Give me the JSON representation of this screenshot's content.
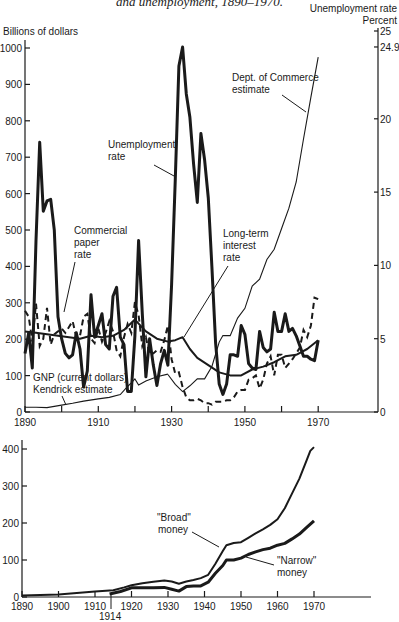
{
  "figure": {
    "title": "and unemployment, 1890–1970."
  },
  "chart_data": [
    {
      "type": "line",
      "title": "and unemployment, 1890–1970.",
      "xlabel": "",
      "ylabel": "Billions of dollars",
      "y2label": "Unemployment rate Percent",
      "xlim": [
        1890,
        1985
      ],
      "ylim": [
        0,
        1000
      ],
      "y2lim": [
        0,
        25
      ],
      "x_ticks": [
        1890,
        1900,
        1910,
        1920,
        1930,
        1940,
        1950,
        1960,
        1970
      ],
      "x_tick_labels": [
        "1890",
        "1910",
        "1930",
        "1950",
        "1970"
      ],
      "y_ticks": [
        0,
        100,
        200,
        300,
        400,
        500,
        600,
        700,
        800,
        900,
        1000
      ],
      "y2_ticks": [
        0,
        5,
        10,
        15,
        20,
        24.9,
        25
      ],
      "grid": false,
      "legend": "inline labels",
      "annotations": [
        "Unemployment rate",
        "Commercial paper rate",
        "Long-term interest rate",
        "Dept. of Commerce estimate",
        "GNP (current dollars) Kendrick estimate"
      ],
      "series": [
        {
          "name": "GNP (current dollars) Kendrick estimate",
          "axis": "left",
          "style": "thin",
          "x": [
            1890,
            1893,
            1896,
            1900,
            1903,
            1906,
            1910,
            1913,
            1916,
            1918,
            1919,
            1920,
            1921,
            1923,
            1926,
            1929
          ],
          "y": [
            13,
            13,
            12,
            19,
            24,
            30,
            36,
            40,
            48,
            70,
            80,
            91,
            74,
            85,
            97,
            104
          ]
        },
        {
          "name": "GNP (current dollars) Dept. of Commerce estimate",
          "axis": "left",
          "style": "thin",
          "x": [
            1929,
            1931,
            1933,
            1935,
            1937,
            1939,
            1941,
            1943,
            1944,
            1946,
            1948,
            1950,
            1952,
            1954,
            1956,
            1958,
            1960,
            1962,
            1964,
            1966,
            1968,
            1970
          ],
          "y": [
            103,
            76,
            56,
            72,
            91,
            91,
            125,
            192,
            210,
            210,
            258,
            285,
            346,
            365,
            419,
            447,
            504,
            560,
            632,
            750,
            865,
            975
          ]
        },
        {
          "name": "Unemployment rate",
          "axis": "right",
          "unit": "%",
          "style": "thick",
          "x": [
            1890,
            1891,
            1892,
            1893,
            1894,
            1895,
            1896,
            1897,
            1898,
            1899,
            1900,
            1901,
            1902,
            1903,
            1904,
            1905,
            1906,
            1907,
            1908,
            1909,
            1910,
            1911,
            1912,
            1913,
            1914,
            1915,
            1916,
            1917,
            1918,
            1919,
            1920,
            1921,
            1922,
            1923,
            1924,
            1925,
            1926,
            1927,
            1928,
            1929,
            1930,
            1931,
            1932,
            1933,
            1934,
            1935,
            1936,
            1937,
            1938,
            1939,
            1940,
            1941,
            1942,
            1943,
            1944,
            1945,
            1946,
            1947,
            1948,
            1949,
            1950,
            1951,
            1952,
            1953,
            1954,
            1955,
            1956,
            1957,
            1958,
            1959,
            1960,
            1961,
            1962,
            1963,
            1964,
            1965,
            1966,
            1967,
            1968,
            1969,
            1970
          ],
          "y": [
            4.0,
            5.4,
            3.0,
            11.7,
            18.4,
            13.7,
            14.4,
            14.5,
            12.4,
            6.5,
            5.0,
            4.0,
            3.7,
            3.9,
            5.4,
            4.3,
            1.7,
            2.8,
            8.0,
            5.1,
            5.9,
            6.7,
            4.6,
            4.3,
            7.9,
            8.5,
            5.1,
            4.6,
            1.4,
            1.4,
            5.2,
            11.7,
            6.7,
            2.4,
            5.0,
            3.2,
            1.8,
            3.3,
            4.2,
            3.2,
            8.7,
            15.9,
            23.6,
            24.9,
            21.7,
            20.1,
            16.9,
            14.3,
            19.0,
            17.2,
            14.6,
            9.9,
            4.7,
            1.9,
            1.2,
            1.9,
            3.9,
            3.9,
            3.8,
            5.9,
            5.3,
            3.3,
            3.0,
            2.9,
            5.5,
            4.4,
            4.1,
            4.3,
            6.8,
            5.5,
            5.5,
            6.7,
            5.5,
            5.7,
            5.2,
            4.5,
            3.8,
            3.8,
            3.6,
            3.5,
            4.9
          ]
        },
        {
          "name": "Commercial paper rate",
          "axis": "right",
          "unit": "%",
          "style": "dashed",
          "x": [
            1890,
            1891,
            1892,
            1893,
            1894,
            1895,
            1896,
            1897,
            1898,
            1899,
            1900,
            1901,
            1902,
            1903,
            1904,
            1905,
            1906,
            1907,
            1908,
            1909,
            1910,
            1911,
            1912,
            1913,
            1914,
            1915,
            1916,
            1917,
            1918,
            1919,
            1920,
            1921,
            1922,
            1923,
            1924,
            1925,
            1926,
            1927,
            1928,
            1929,
            1930,
            1931,
            1932,
            1933,
            1934,
            1935,
            1936,
            1937,
            1938,
            1939,
            1940,
            1941,
            1942,
            1943,
            1944,
            1945,
            1946,
            1947,
            1948,
            1949,
            1950,
            1951,
            1952,
            1953,
            1954,
            1955,
            1956,
            1957,
            1958,
            1959,
            1960,
            1961,
            1962,
            1963,
            1964,
            1965,
            1966,
            1967,
            1968,
            1969,
            1970
          ],
          "y": [
            6.9,
            6.5,
            4.8,
            7.4,
            4.5,
            5.0,
            7.1,
            4.6,
            5.3,
            5.5,
            5.7,
            5.4,
            5.8,
            6.2,
            5.1,
            5.2,
            6.5,
            6.7,
            5.0,
            4.7,
            5.7,
            4.8,
            5.4,
            6.2,
            5.5,
            4.2,
            3.8,
            5.1,
            6.0,
            5.4,
            7.5,
            6.6,
            4.5,
            5.1,
            3.9,
            4.0,
            4.2,
            4.1,
            4.9,
            5.9,
            3.6,
            2.6,
            2.7,
            1.7,
            1.0,
            0.8,
            0.8,
            0.9,
            0.8,
            0.6,
            0.6,
            0.5,
            0.7,
            0.7,
            0.7,
            0.8,
            0.8,
            1.0,
            1.4,
            1.5,
            1.5,
            2.2,
            2.3,
            2.5,
            1.6,
            2.2,
            3.3,
            3.8,
            2.5,
            3.9,
            3.9,
            3.0,
            3.3,
            3.6,
            4.0,
            4.4,
            5.6,
            5.1,
            5.9,
            7.8,
            7.7
          ]
        },
        {
          "name": "Long-term interest rate",
          "axis": "right",
          "unit": "%",
          "style": "medium",
          "x": [
            1890,
            1893,
            1896,
            1899,
            1902,
            1905,
            1908,
            1911,
            1914,
            1917,
            1920,
            1923,
            1926,
            1929,
            1931,
            1933,
            1935,
            1937,
            1940,
            1943,
            1946,
            1949,
            1952,
            1955,
            1958,
            1961,
            1964,
            1967,
            1970
          ],
          "y": [
            5.5,
            5.4,
            5.3,
            5.2,
            5.1,
            5.0,
            5.2,
            5.1,
            5.2,
            5.6,
            6.3,
            5.5,
            5.0,
            4.8,
            4.9,
            5.1,
            4.3,
            3.7,
            3.2,
            2.7,
            2.5,
            2.5,
            2.9,
            3.1,
            3.4,
            3.8,
            3.9,
            4.3,
            4.9
          ]
        }
      ]
    },
    {
      "type": "line",
      "title": "",
      "xlabel": "",
      "ylabel": "",
      "xlim": [
        1890,
        1985
      ],
      "ylim": [
        0,
        400
      ],
      "x_ticks": [
        1890,
        1900,
        1910,
        1920,
        1930,
        1940,
        1950,
        1960,
        1970
      ],
      "x_tick_labels": [
        "1890",
        "1900",
        "1910",
        "1920",
        "1930",
        "1940",
        "1950",
        "1960",
        "1970"
      ],
      "y_ticks": [
        0,
        100,
        200,
        300,
        400
      ],
      "grid": false,
      "annotations": [
        "1914",
        "\"Broad\" money",
        "\"Narrow\" money"
      ],
      "series": [
        {
          "name": "\"Broad\" money",
          "style": "medium",
          "x": [
            1890,
            1895,
            1900,
            1905,
            1910,
            1915,
            1918,
            1920,
            1923,
            1926,
            1929,
            1931,
            1933,
            1935,
            1937,
            1939,
            1941,
            1943,
            1945,
            1946,
            1948,
            1950,
            1952,
            1954,
            1956,
            1958,
            1960,
            1962,
            1964,
            1966,
            1968,
            1969,
            1970
          ],
          "y": [
            4,
            5,
            7,
            11,
            15,
            18,
            26,
            32,
            37,
            41,
            45,
            42,
            36,
            42,
            46,
            51,
            60,
            90,
            124,
            140,
            146,
            148,
            160,
            172,
            183,
            195,
            210,
            240,
            280,
            320,
            370,
            395,
            405
          ]
        },
        {
          "name": "\"Narrow\" money",
          "style": "thick",
          "x": [
            1914,
            1917,
            1920,
            1923,
            1926,
            1929,
            1931,
            1933,
            1935,
            1937,
            1939,
            1941,
            1943,
            1945,
            1946,
            1948,
            1950,
            1952,
            1954,
            1956,
            1958,
            1960,
            1962,
            1964,
            1966,
            1968,
            1970
          ],
          "y": [
            8,
            15,
            25,
            25,
            25,
            26,
            21,
            16,
            28,
            30,
            30,
            40,
            64,
            85,
            100,
            100,
            105,
            115,
            122,
            128,
            132,
            140,
            145,
            157,
            170,
            188,
            206
          ]
        }
      ]
    }
  ],
  "labels": {
    "y_left_title": "Billions of dollars",
    "y_right_title_1": "Unemployment rate",
    "y_right_title_2": "Percent",
    "unemployment_1": "Unemployment",
    "unemployment_2": "rate",
    "commercial_1": "Commercial",
    "commercial_2": "paper",
    "commercial_3": "rate",
    "longterm_1": "Long-term",
    "longterm_2": "interest",
    "longterm_3": "rate",
    "commerce_1": "Dept. of Commerce",
    "commerce_2": "estimate",
    "gnp_1": "GNP (current dollars)",
    "gnp_2": "Kendrick estimate",
    "broad_1": "\"Broad\"",
    "broad_2": "money",
    "narrow_1": "\"Narrow\"",
    "narrow_2": "money",
    "year_1914": "1914"
  }
}
